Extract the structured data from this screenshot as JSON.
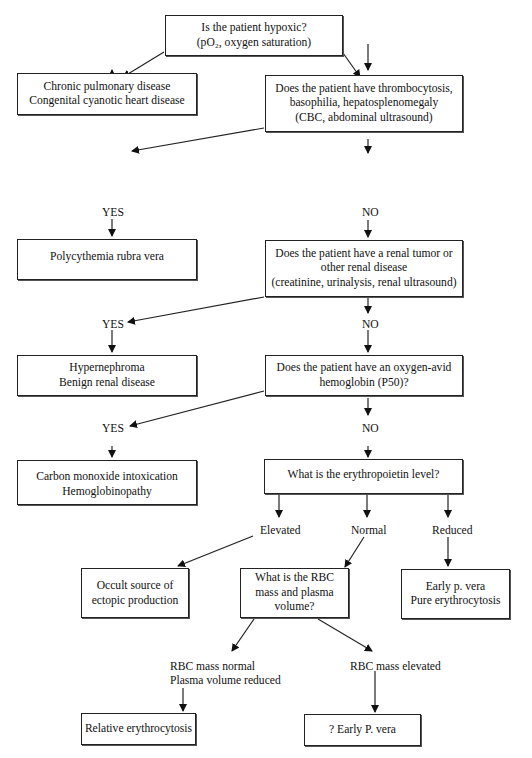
{
  "diagram": {
    "type": "flowchart",
    "nodes": {
      "hypoxic": {
        "lines": [
          "Is the patient hypoxic?",
          "(pO₂, oxygen saturation)"
        ]
      },
      "pulmonary": {
        "lines": [
          "Chronic pulmonary disease",
          "Congenital cyanotic heart disease"
        ]
      },
      "thrombo": {
        "lines": [
          "Does the patient have thrombocytosis,",
          "basophilia, hepatosplenomegaly",
          "(CBC, abdominal ultrasound)"
        ]
      },
      "prv": {
        "lines": [
          "Polycythemia rubra vera"
        ]
      },
      "renal_q": {
        "lines": [
          "Does the patient have a renal tumor or",
          "other renal disease",
          "(creatinine, urinalysis, renal ultrasound)"
        ]
      },
      "renal_dx": {
        "lines": [
          "Hypernephroma",
          "Benign renal disease"
        ]
      },
      "hb_q": {
        "lines": [
          "Does the patient have an oxygen-avid",
          "hemoglobin (P50)?"
        ]
      },
      "co_dx": {
        "lines": [
          "Carbon monoxide intoxication",
          "Hemoglobinopathy"
        ]
      },
      "epo_q": {
        "lines": [
          "What is the erythropoietin level?"
        ]
      },
      "occult": {
        "lines": [
          "Occult source of",
          "ectopic production"
        ]
      },
      "rbc_q": {
        "lines": [
          "What is the RBC",
          "mass and plasma",
          "volume?"
        ]
      },
      "early_pv": {
        "lines": [
          "Early p. vera",
          "Pure erythrocytosis"
        ]
      },
      "relative": {
        "lines": [
          "Relative erythrocytosis"
        ]
      },
      "q_early_pv": {
        "lines": [
          "? Early P. vera"
        ]
      }
    },
    "labels": {
      "yes": "YES",
      "no": "NO",
      "elevated": "Elevated",
      "normal": "Normal",
      "reduced": "Reduced",
      "rbc_normal_1": "RBC mass normal",
      "rbc_normal_2": "Plasma volume reduced",
      "rbc_elevated": "RBC mass elevated"
    },
    "colors": {
      "line": "#222222",
      "background": "#ffffff"
    }
  }
}
